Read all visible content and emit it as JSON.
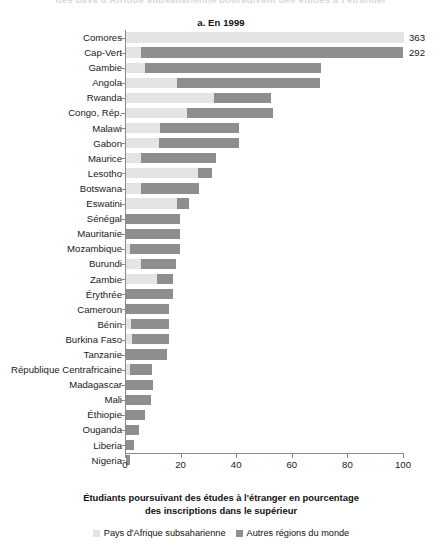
{
  "figure": {
    "cropped_top_title": "des pays d'Afrique subsaharienne poursuivent des études à l'étranger",
    "panel_title": "a. En 1999",
    "axis_caption_line1": "Étudiants poursuivant des études à l'étranger en pourcentage",
    "axis_caption_line2": "des inscriptions dans le supérieur"
  },
  "legend": {
    "items": [
      {
        "label": "Pays d'Afrique subsaharienne",
        "color": "#e4e4e4",
        "key": "sub_saharan"
      },
      {
        "label": "Autres régions du monde",
        "color": "#8e8e8e",
        "key": "rest_of_world"
      }
    ]
  },
  "axis": {
    "ticks": [
      0,
      20,
      40,
      60,
      80,
      100
    ],
    "tick_labels": [
      "0",
      "20",
      "40",
      "60",
      "80",
      "100"
    ],
    "min": 0,
    "max": 100
  },
  "chart_data": {
    "type": "bar",
    "orientation": "horizontal",
    "stacked": true,
    "title": "a. En 1999",
    "xlabel": "Étudiants poursuivant des études à l'étranger en pourcentage des inscriptions dans le supérieur",
    "ylabel": "",
    "xlim": [
      0,
      100
    ],
    "grid": false,
    "legend_position": "bottom",
    "categories": [
      "Comores",
      "Cap-Vert",
      "Gambie",
      "Angola",
      "Rwanda",
      "Congo, Rép.",
      "Malawi",
      "Gabon",
      "Maurice",
      "Lesotho",
      "Botswana",
      "Eswatini",
      "Sénégal",
      "Mauritanie",
      "Mozambique",
      "Burundi",
      "Zambie",
      "Érythrée",
      "Cameroun",
      "Bénin",
      "Burkina Faso",
      "Tanzanie",
      "République Centrafricaine",
      "Madagascar",
      "Mali",
      "Éthiopie",
      "Ouganda",
      "Liberia",
      "Nigeria"
    ],
    "series": [
      {
        "name": "Pays d'Afrique subsaharienne",
        "color": "#e4e4e4",
        "values": [
          100,
          5.7,
          7,
          18.5,
          32,
          22,
          12.5,
          12,
          5.5,
          26,
          5.5,
          18.5,
          0,
          0,
          1.5,
          5.7,
          11.5,
          0,
          0,
          2,
          2.5,
          0,
          1.5,
          0,
          0,
          0,
          0,
          0,
          0
        ]
      },
      {
        "name": "Autres régions du monde",
        "color": "#8e8e8e",
        "values": [
          0,
          94.3,
          63.5,
          51.5,
          20.5,
          31,
          28.5,
          29,
          27,
          5,
          21,
          4.5,
          19.5,
          19.5,
          18,
          12.3,
          5.5,
          17,
          15.5,
          13.5,
          13,
          15,
          8,
          10,
          9,
          7,
          5,
          3,
          1.5
        ]
      }
    ],
    "totals": [
      363,
      292,
      70.5,
      70,
      52,
      53,
      41,
      41,
      32.5,
      31,
      26.5,
      23,
      19.5,
      19.5,
      19.5,
      18,
      17,
      17,
      15.5,
      15.5,
      15.5,
      15,
      9.5,
      10,
      9,
      7,
      5,
      3,
      1.5
    ],
    "value_labels": [
      {
        "category": "Comores",
        "text": "363"
      },
      {
        "category": "Cap-Vert",
        "text": "292"
      }
    ],
    "note": "Comores and Cap-Vert bars are truncated at the 100% axis limit; their actual totals are shown as labels."
  },
  "rows": [
    {
      "label": "Comores",
      "light": 100,
      "dark": 0,
      "value": "363"
    },
    {
      "label": "Cap-Vert",
      "light": 5.7,
      "dark": 94.3,
      "value": "292"
    },
    {
      "label": "Gambie",
      "light": 7,
      "dark": 63.5,
      "value": ""
    },
    {
      "label": "Angola",
      "light": 18.5,
      "dark": 51.5,
      "value": ""
    },
    {
      "label": "Rwanda",
      "light": 32,
      "dark": 20.5,
      "value": ""
    },
    {
      "label": "Congo, Rép.",
      "light": 22,
      "dark": 31,
      "value": ""
    },
    {
      "label": "Malawi",
      "light": 12.5,
      "dark": 28.5,
      "value": ""
    },
    {
      "label": "Gabon",
      "light": 12,
      "dark": 29,
      "value": ""
    },
    {
      "label": "Maurice",
      "light": 5.5,
      "dark": 27,
      "value": ""
    },
    {
      "label": "Lesotho",
      "light": 26,
      "dark": 5,
      "value": ""
    },
    {
      "label": "Botswana",
      "light": 5.5,
      "dark": 21,
      "value": ""
    },
    {
      "label": "Eswatini",
      "light": 18.5,
      "dark": 4.5,
      "value": ""
    },
    {
      "label": "Sénégal",
      "light": 0,
      "dark": 19.5,
      "value": ""
    },
    {
      "label": "Mauritanie",
      "light": 0,
      "dark": 19.5,
      "value": ""
    },
    {
      "label": "Mozambique",
      "light": 1.5,
      "dark": 18,
      "value": ""
    },
    {
      "label": "Burundi",
      "light": 5.7,
      "dark": 12.3,
      "value": ""
    },
    {
      "label": "Zambie",
      "light": 11.5,
      "dark": 5.5,
      "value": ""
    },
    {
      "label": "Érythrée",
      "light": 0,
      "dark": 17,
      "value": ""
    },
    {
      "label": "Cameroun",
      "light": 0,
      "dark": 15.5,
      "value": ""
    },
    {
      "label": "Bénin",
      "light": 2,
      "dark": 13.5,
      "value": ""
    },
    {
      "label": "Burkina Faso",
      "light": 2.5,
      "dark": 13,
      "value": ""
    },
    {
      "label": "Tanzanie",
      "light": 0,
      "dark": 15,
      "value": ""
    },
    {
      "label": "République Centrafricaine",
      "light": 1.5,
      "dark": 8,
      "value": ""
    },
    {
      "label": "Madagascar",
      "light": 0,
      "dark": 10,
      "value": ""
    },
    {
      "label": "Mali",
      "light": 0,
      "dark": 9,
      "value": ""
    },
    {
      "label": "Éthiopie",
      "light": 0,
      "dark": 7,
      "value": ""
    },
    {
      "label": "Ouganda",
      "light": 0,
      "dark": 5,
      "value": ""
    },
    {
      "label": "Liberia",
      "light": 0,
      "dark": 3,
      "value": ""
    },
    {
      "label": "Nigeria",
      "light": 0,
      "dark": 1.5,
      "value": ""
    }
  ]
}
